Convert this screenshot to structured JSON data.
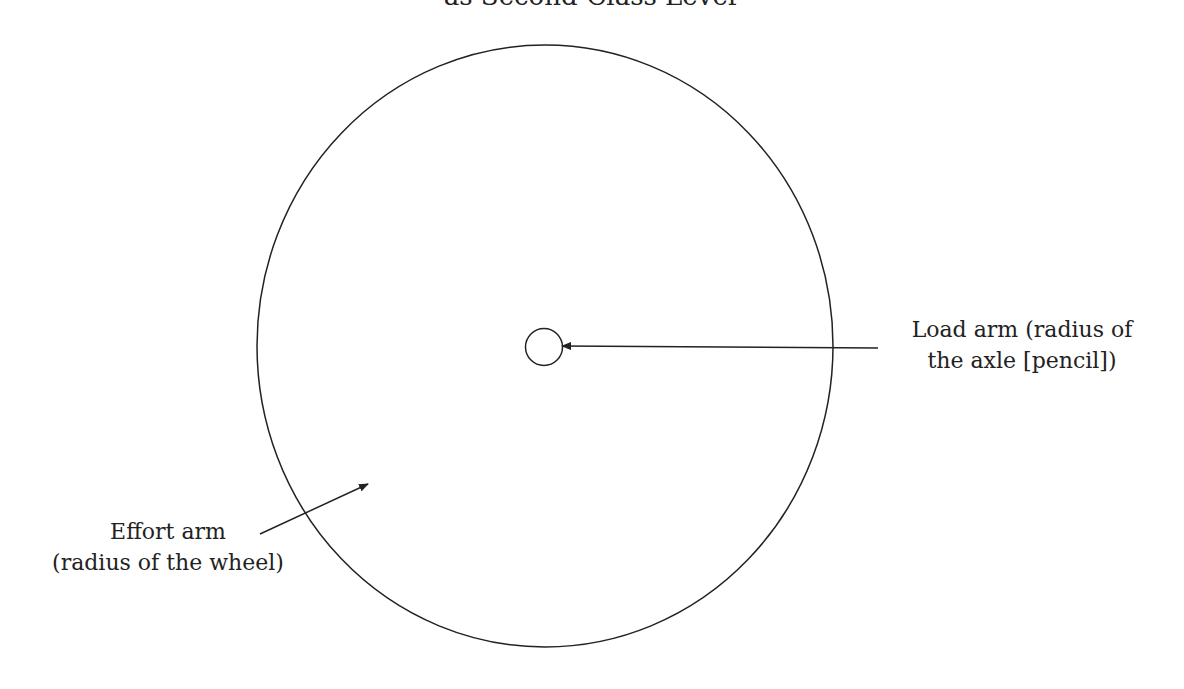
{
  "title": "as Second-Class Lever",
  "labels": {
    "load_arm": {
      "line1": "Load arm (radius of",
      "line2": "the axle [pencil])"
    },
    "effort_arm": {
      "line1": "Effort arm",
      "line2": "(radius of the wheel)"
    }
  },
  "shapes": {
    "wheel": {
      "cx": 545,
      "cy": 346,
      "rx": 288,
      "ry": 301
    },
    "axle": {
      "cx": 544,
      "cy": 347,
      "r": 18.5
    },
    "load_arrow": {
      "x1": 878,
      "y1": 348,
      "x2": 562,
      "y2": 346
    },
    "effort_arrow": {
      "x1": 260,
      "y1": 534,
      "x2": 368,
      "y2": 484
    }
  },
  "colors": {
    "stroke": "#222222",
    "background": "#ffffff"
  }
}
